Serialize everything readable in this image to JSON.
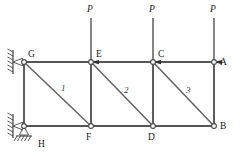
{
  "figure": {
    "type": "structural-truss-diagram",
    "title": "",
    "colors": {
      "member": "#555555",
      "diagonal": "#666666",
      "node_stroke": "#4a4a4a",
      "node_fill": "#ffffff",
      "arrow": "#333333",
      "support": "#444444",
      "text": "#1a1a1a",
      "background": "#ffffff"
    },
    "geometry": {
      "top_chord_y": 62,
      "bottom_chord_y": 126,
      "panel_x": [
        24,
        91,
        153,
        214
      ]
    },
    "nodes": [
      {
        "id": "G",
        "label": "G",
        "x": 24,
        "y": 62,
        "label_x": 28,
        "label_y": 50
      },
      {
        "id": "E",
        "label": "E",
        "x": 91,
        "y": 62,
        "label_x": 96,
        "label_y": 50
      },
      {
        "id": "C",
        "label": "C",
        "x": 153,
        "y": 62,
        "label_x": 158,
        "label_y": 50
      },
      {
        "id": "A",
        "label": "A",
        "x": 214,
        "y": 62,
        "label_x": 220,
        "label_y": 58
      },
      {
        "id": "H",
        "label": "H",
        "x": 24,
        "y": 126,
        "label_x": 38,
        "label_y": 140
      },
      {
        "id": "F",
        "label": "F",
        "x": 91,
        "y": 126,
        "label_x": 86,
        "label_y": 133
      },
      {
        "id": "D",
        "label": "D",
        "x": 153,
        "y": 126,
        "label_x": 148,
        "label_y": 133
      },
      {
        "id": "B",
        "label": "B",
        "x": 214,
        "y": 126,
        "label_x": 220,
        "label_y": 122
      }
    ],
    "members": {
      "top_chord": [
        {
          "name": "G-E",
          "x1": 24,
          "y1": 62,
          "x2": 91,
          "y2": 62
        },
        {
          "name": "E-C",
          "x1": 91,
          "y1": 62,
          "x2": 153,
          "y2": 62
        },
        {
          "name": "C-A",
          "x1": 153,
          "y1": 62,
          "x2": 214,
          "y2": 62
        }
      ],
      "bottom_chord": [
        {
          "name": "H-F",
          "x1": 24,
          "y1": 126,
          "x2": 91,
          "y2": 126
        },
        {
          "name": "F-D",
          "x1": 91,
          "y1": 126,
          "x2": 153,
          "y2": 126
        },
        {
          "name": "D-B",
          "x1": 153,
          "y1": 126,
          "x2": 214,
          "y2": 126
        }
      ],
      "verticals": [
        {
          "name": "G-H",
          "x1": 24,
          "y1": 62,
          "x2": 24,
          "y2": 126
        },
        {
          "name": "E-F",
          "x1": 91,
          "y1": 62,
          "x2": 91,
          "y2": 126
        },
        {
          "name": "C-D",
          "x1": 153,
          "y1": 62,
          "x2": 153,
          "y2": 126
        },
        {
          "name": "A-B",
          "x1": 214,
          "y1": 62,
          "x2": 214,
          "y2": 126
        }
      ],
      "diagonals": [
        {
          "name": "G-F",
          "label": "1",
          "x1": 24,
          "y1": 62,
          "x2": 91,
          "y2": 126,
          "label_x": 61,
          "label_y": 84
        },
        {
          "name": "E-D",
          "label": "2",
          "x1": 91,
          "y1": 62,
          "x2": 153,
          "y2": 126,
          "label_x": 124,
          "label_y": 86
        },
        {
          "name": "C-B",
          "label": "3",
          "x1": 153,
          "y1": 62,
          "x2": 214,
          "y2": 126,
          "label_x": 186,
          "label_y": 86
        }
      ]
    },
    "loads": [
      {
        "name": "load-at-E",
        "label": "P",
        "x": 91,
        "tail_y": 18,
        "tip_y": 62,
        "label_x": 87,
        "label_y": 5
      },
      {
        "name": "load-at-C",
        "label": "P",
        "x": 153,
        "tail_y": 18,
        "tip_y": 62,
        "label_x": 149,
        "label_y": 5
      },
      {
        "name": "load-at-A",
        "label": "P",
        "x": 214,
        "tail_y": 18,
        "tip_y": 62,
        "label_x": 210,
        "label_y": 5
      }
    ],
    "supports": [
      {
        "name": "wall-support-G",
        "node": "G",
        "kind": "pinned-wall",
        "x": 24,
        "y": 62
      },
      {
        "name": "wall-support-H",
        "node": "H",
        "kind": "pinned-wall",
        "x": 24,
        "y": 126
      },
      {
        "name": "ground-support-H",
        "node": "H",
        "kind": "pinned-ground",
        "x": 24,
        "y": 126
      }
    ]
  }
}
